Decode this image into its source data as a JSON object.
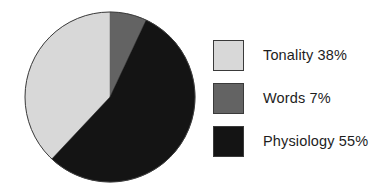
{
  "chart_data": {
    "type": "pie",
    "title": "",
    "subtitle": "",
    "xlabel": "",
    "ylabel": "",
    "grid": false,
    "legend_position": "right",
    "start_angle_deg": -90,
    "direction": "counterclockwise-first-slice",
    "categories": [
      "Tonality",
      "Words",
      "Physiology"
    ],
    "values": [
      38,
      7,
      55
    ],
    "units": "%",
    "slices": [
      {
        "label": "Tonality",
        "value": 38,
        "display": "Tonality 38%",
        "color": "#d8d8d8",
        "swatch_name": "tonality-swatch"
      },
      {
        "label": "Words",
        "value": 7,
        "display": "Words 7%",
        "color": "#636363",
        "swatch_name": "words-swatch"
      },
      {
        "label": "Physiology",
        "value": 55,
        "display": "Physiology 55%",
        "color": "#141414",
        "swatch_name": "physiology-swatch"
      }
    ],
    "legend_entries": [
      "Tonality 38%",
      "Words 7%",
      "Physiology 55%"
    ],
    "colors": {
      "tonality": "#d8d8d8",
      "words": "#636363",
      "physiology": "#141414",
      "outline": "#3a3a3a",
      "background": "#ffffff",
      "text": "#1d1d1d"
    },
    "geometry": {
      "center_x": 86,
      "center_y": 86,
      "radius": 85
    }
  }
}
